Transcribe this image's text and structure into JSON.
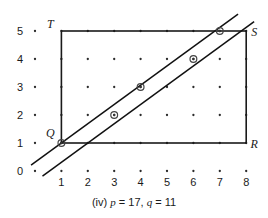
{
  "figure": {
    "caption_index": "(iv)",
    "caption_p_var": "p",
    "caption_p_eq": "= 17,",
    "caption_q_var": "q",
    "caption_q_eq": "= 11",
    "caption_full": "(iv) p = 17, q = 11"
  },
  "axes": {
    "x_ticks": [
      "1",
      "2",
      "3",
      "4",
      "5",
      "6",
      "7",
      "8"
    ],
    "y_ticks": [
      "0",
      "1",
      "2",
      "3",
      "4",
      "5"
    ],
    "x_min": 0,
    "x_max": 8,
    "y_min": 0,
    "y_max": 5
  },
  "vertices": [
    {
      "name": "T",
      "label": "T",
      "x": 1,
      "y": 5
    },
    {
      "name": "S",
      "label": "S",
      "x": 8,
      "y": 5
    },
    {
      "name": "R",
      "label": "R",
      "x": 8,
      "y": 1
    },
    {
      "name": "Q",
      "label": "Q",
      "x": 1,
      "y": 1
    }
  ],
  "rectangle": {
    "x1": 1,
    "y1": 1,
    "x2": 8,
    "y2": 5
  },
  "lines": [
    {
      "name": "upper-line",
      "slope": 0.6875,
      "intercept": 0.3125
    },
    {
      "name": "lower-line",
      "slope": 0.6875,
      "intercept": -0.375
    }
  ],
  "marked_points": [
    {
      "x": 1,
      "y": 1
    },
    {
      "x": 3,
      "y": 2
    },
    {
      "x": 4,
      "y": 3
    },
    {
      "x": 6,
      "y": 4
    },
    {
      "x": 7,
      "y": 5
    }
  ],
  "colors": {
    "ink": "#1a1a1a",
    "line": "#111111",
    "dot": "#2b2b2b",
    "background": "#ffffff"
  }
}
